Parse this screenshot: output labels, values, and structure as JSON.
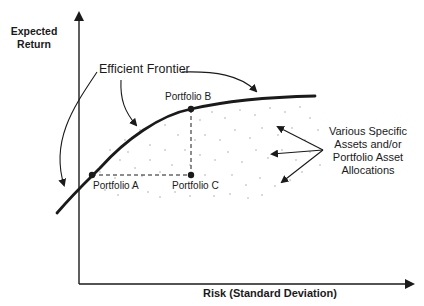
{
  "diagram": {
    "title": "Efficient Frontier",
    "axes": {
      "y_label_line1": "Expected",
      "y_label_line2": "Return",
      "x_label": "Risk (Standard Deviation)"
    },
    "curve_label": "Efficient Frontier",
    "points": [
      {
        "id": "A",
        "label": "Portfolio A",
        "on_frontier": true
      },
      {
        "id": "B",
        "label": "Portfolio B",
        "on_frontier": true
      },
      {
        "id": "C",
        "label": "Portfolio C",
        "on_frontier": false
      }
    ],
    "region_label": {
      "line1": "Various Specific",
      "line2": "Assets and/or",
      "line3": "Portfolio Asset",
      "line4": "Allocations"
    },
    "colors": {
      "ink": "#1a1a1a",
      "background": "#ffffff",
      "dots": "#9a9a9a"
    }
  }
}
